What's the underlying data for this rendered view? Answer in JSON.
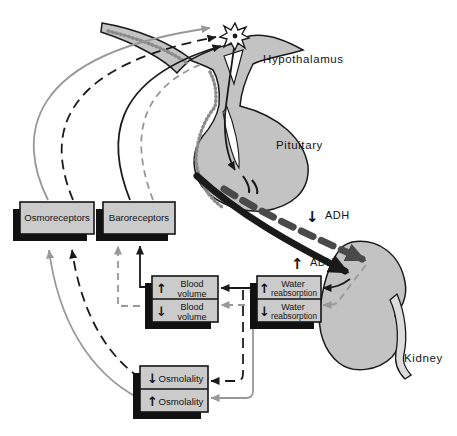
{
  "anatomy_labels": {
    "hypothalamus": "Hypothalamus",
    "pituitary": "Pituitary",
    "kidney": "Kidney"
  },
  "adh_labels": {
    "decreased_adh": {
      "arrow": "↓",
      "text": "ADH"
    },
    "increased_adh": {
      "arrow": "↑",
      "text": "ADH"
    }
  },
  "receptor_boxes": {
    "osmoreceptors": {
      "label": "Osmoreceptors"
    },
    "baroreceptors": {
      "label": "Baroreceptors"
    }
  },
  "state_boxes": {
    "blood_volume_up": {
      "arrow": "↑",
      "line1": "Blood",
      "line2": "volume"
    },
    "blood_volume_down": {
      "arrow": "↓",
      "line1": "Blood",
      "line2": "volume"
    },
    "water_reabsorption_up": {
      "arrow": "↑",
      "line1": "Water",
      "line2": "reabsorption"
    },
    "water_reabsorption_down": {
      "arrow": "↓",
      "line1": "Water",
      "line2": "reabsorption"
    },
    "osmolality_down": {
      "arrow": "↓",
      "label": "Osmolality"
    },
    "osmolality_up": {
      "arrow": "↑",
      "label": "Osmolality"
    }
  },
  "colors": {
    "background": "#ffffff",
    "organ_fill": "#c3c3c3",
    "box_fill": "#cbcbcb",
    "outline": "#1a1a1a",
    "gray_line": "#98989a",
    "adh_dash_arrow": "#4a4a4a",
    "stipple": "#8a8a8a"
  }
}
